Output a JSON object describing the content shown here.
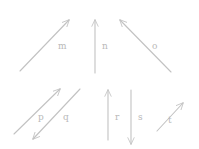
{
  "figure": {
    "background_color": "#ffffff",
    "stroke_color": "#c2c2c2",
    "label_color": "#b9b9b9",
    "stroke_width": 1.1,
    "width": 199,
    "height": 149
  },
  "chart_data": {
    "type": "diagram",
    "title": "",
    "xlabel": "",
    "ylabel": "",
    "grid": false,
    "legend": false,
    "xlim": [
      0,
      199
    ],
    "ylim": [
      0,
      149
    ],
    "series": [
      {
        "name": "m",
        "label": "m",
        "direction": "up-right",
        "x1": 20,
        "y1": 71,
        "x2": 69,
        "y2": 20,
        "arrowhead": "end",
        "label_x": 58,
        "label_y": 42
      },
      {
        "name": "n",
        "label": "n",
        "direction": "up",
        "x1": 95,
        "y1": 73,
        "x2": 95,
        "y2": 20,
        "arrowhead": "end",
        "label_x": 102,
        "label_y": 42
      },
      {
        "name": "o",
        "label": "o",
        "direction": "up-left",
        "x1": 171,
        "y1": 72,
        "x2": 120,
        "y2": 20,
        "arrowhead": "end",
        "label_x": 152,
        "label_y": 42
      },
      {
        "name": "p",
        "label": "p",
        "direction": "up-right",
        "x1": 14,
        "y1": 134,
        "x2": 60,
        "y2": 89,
        "arrowhead": "end",
        "label_x": 38,
        "label_y": 113
      },
      {
        "name": "q",
        "label": "q",
        "direction": "down-left",
        "x1": 80,
        "y1": 89,
        "x2": 33,
        "y2": 139,
        "arrowhead": "end",
        "label_x": 63,
        "label_y": 113
      },
      {
        "name": "r",
        "label": "r",
        "direction": "up",
        "x1": 108,
        "y1": 140,
        "x2": 108,
        "y2": 90,
        "arrowhead": "end",
        "label_x": 115,
        "label_y": 113
      },
      {
        "name": "s",
        "label": "s",
        "direction": "down",
        "x1": 131,
        "y1": 90,
        "x2": 131,
        "y2": 144,
        "arrowhead": "end",
        "label_x": 138,
        "label_y": 113
      },
      {
        "name": "t",
        "label": "t",
        "direction": "up-right",
        "x1": 157,
        "y1": 131,
        "x2": 183,
        "y2": 103,
        "arrowhead": "end",
        "label_x": 168,
        "label_y": 116
      }
    ]
  }
}
